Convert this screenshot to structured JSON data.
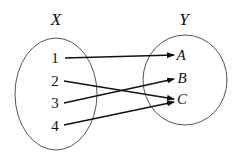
{
  "diagram": {
    "type": "mapping",
    "domain": {
      "label": "X",
      "elements": [
        "1",
        "2",
        "3",
        "4"
      ]
    },
    "codomain": {
      "label": "Y",
      "elements": [
        "A",
        "B",
        "C"
      ]
    },
    "mappings": [
      {
        "from": "1",
        "to": "A"
      },
      {
        "from": "2",
        "to": "C"
      },
      {
        "from": "3",
        "to": "B"
      },
      {
        "from": "4",
        "to": "C"
      }
    ],
    "colors": {
      "stroke": "#111111",
      "ellipse": "#555555",
      "background": "#ffffff"
    }
  }
}
